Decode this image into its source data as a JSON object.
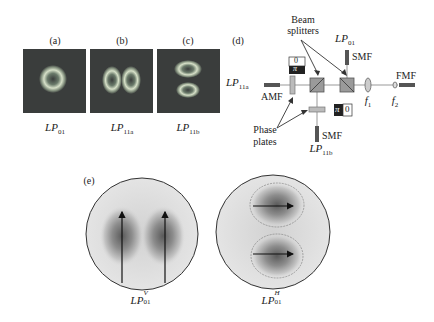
{
  "figure": {
    "panels": {
      "a": {
        "label": "(a)",
        "mode": "LP",
        "sub": "01"
      },
      "b": {
        "label": "(b)",
        "mode": "LP",
        "sub": "11a"
      },
      "c": {
        "label": "(c)",
        "mode": "LP",
        "sub": "11b"
      },
      "d": {
        "label": "(d)"
      },
      "e": {
        "label": "(e)"
      }
    },
    "setup": {
      "beam_splitters_label_1": "Beam",
      "beam_splitters_label_2": "splitters",
      "phase_plates_label_1": "Phase",
      "phase_plates_label_2": "plates",
      "lp01_top": {
        "mode": "LP",
        "sub": "01"
      },
      "lp11a_left": {
        "mode": "LP",
        "sub": "11a"
      },
      "lp11b_bottom": {
        "mode": "LP",
        "sub": "11b"
      },
      "smf_top": "SMF",
      "smf_bottom": "SMF",
      "amf": "AMF",
      "fmf": "FMF",
      "f1": {
        "sym": "f",
        "sub": "1"
      },
      "f2": {
        "sym": "f",
        "sub": "2"
      },
      "phase_plate_1": {
        "top": "0",
        "bottom": "π"
      },
      "phase_plate_2": {
        "left": "π",
        "right": "0"
      }
    },
    "modes_e": {
      "left": {
        "mode": "LP",
        "sup": "V",
        "sub": "01"
      },
      "right": {
        "mode": "LP",
        "sup": "H",
        "sub": "01"
      }
    }
  }
}
